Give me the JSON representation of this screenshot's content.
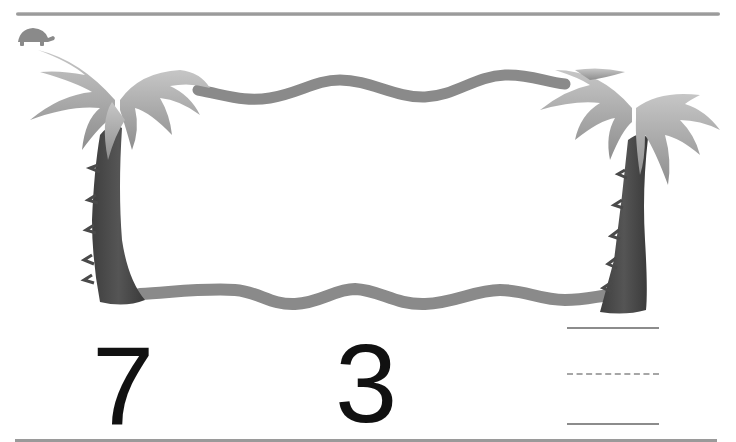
{
  "worksheet": {
    "left_number": "7",
    "right_number": "3",
    "answer_box": {
      "lines": [
        "solid",
        "dashed",
        "solid"
      ],
      "value": ""
    }
  },
  "decorations": {
    "corner_icon": "turtle-icon",
    "frame": "palm-trees-with-rope",
    "colors": {
      "rope": "#8a8a8a",
      "trunk": "#4a4a4a",
      "leaves": "#b0b0b0",
      "rule": "#9a9a9a",
      "digits": "#111111"
    }
  }
}
